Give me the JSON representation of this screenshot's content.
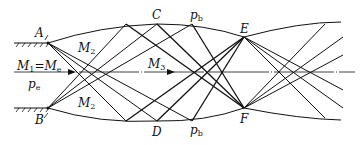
{
  "labels": {
    "A": "A",
    "B": "B",
    "C": "C",
    "D": "D",
    "E": "E",
    "F": "F",
    "M2_top": {
      "base": "M",
      "sub": "2"
    },
    "M2_bottom": {
      "base": "M",
      "sub": "2"
    },
    "M3": {
      "base": "M",
      "sub": "3"
    },
    "M1_eq": {
      "base1": "M",
      "sub1": "1",
      "eq": "=",
      "base2": "M",
      "sub2": "e"
    },
    "pe": {
      "base": "p",
      "sub": "e"
    },
    "pb_top": {
      "base": "p",
      "sub": "b"
    },
    "pb_bottom": {
      "base": "p",
      "sub": "b"
    }
  },
  "colors": {
    "line": "#111111",
    "axis": "#222222"
  }
}
